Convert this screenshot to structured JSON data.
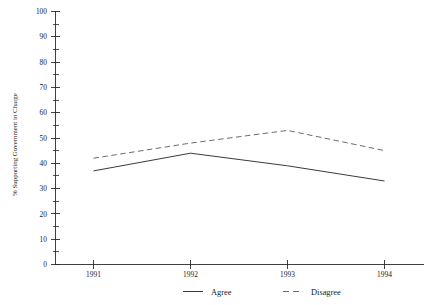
{
  "chart_data": {
    "type": "line",
    "title": "",
    "subtitle": "",
    "xlabel": "",
    "ylabel": "% Supporting Government in Charge",
    "categories": [
      "1991",
      "1992",
      "1993",
      "1994"
    ],
    "x": [
      1991,
      1992,
      1993,
      1994
    ],
    "series": [
      {
        "name": "Agree",
        "values": [
          37,
          44,
          39,
          33
        ],
        "style": "solid"
      },
      {
        "name": "Disagree",
        "values": [
          42,
          48,
          53,
          45
        ],
        "style": "dashed"
      }
    ],
    "ylim": [
      0,
      100
    ],
    "y_ticks": [
      0,
      10,
      20,
      30,
      40,
      50,
      60,
      70,
      80,
      90,
      100
    ],
    "y_tick_labels": [
      "0",
      "10",
      "20",
      "30",
      "40",
      "50",
      "60",
      "70",
      "80",
      "90",
      "100"
    ],
    "y_minor_ticks": [
      5,
      15,
      25,
      35,
      45,
      55,
      65,
      75,
      85,
      95
    ],
    "grid": false,
    "legend_position": "bottom",
    "legend": [
      {
        "label": "Agree",
        "style": "solid"
      },
      {
        "label": "Disagree",
        "style": "dashed"
      }
    ],
    "colors": {
      "axis": "#2b2b2b",
      "agree": "#3a3a3a",
      "disagree": "#6b6b6b",
      "background": "#ffffff"
    }
  },
  "axes": {
    "y_title": "% Supporting Government in Charge",
    "x_tick_labels": [
      "1991",
      "1992",
      "1993",
      "1994"
    ],
    "y_tick_labels": [
      "100",
      "90",
      "80",
      "70",
      "60",
      "50",
      "40",
      "30",
      "20",
      "10",
      "0"
    ]
  },
  "legend": {
    "agree_label": "Agree",
    "disagree_label": "Disagree"
  }
}
